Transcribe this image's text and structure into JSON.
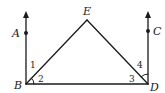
{
  "diagram": {
    "type": "geometry",
    "stroke_color": "#1a1a1a",
    "background": "#ffffff",
    "points": {
      "A": {
        "label": "A",
        "x": 26,
        "y": 33
      },
      "B": {
        "label": "B",
        "x": 26,
        "y": 84
      },
      "C": {
        "label": "C",
        "x": 148,
        "y": 31
      },
      "D": {
        "label": "D",
        "x": 148,
        "y": 84
      },
      "E": {
        "label": "E",
        "x": 87,
        "y": 19
      }
    },
    "angles": {
      "a1": {
        "label": "1"
      },
      "a2": {
        "label": "2"
      },
      "a3": {
        "label": "3"
      },
      "a4": {
        "label": "4"
      }
    },
    "segments": [
      "BE",
      "ED",
      "BD"
    ],
    "rays": [
      "BA",
      "DC"
    ]
  }
}
